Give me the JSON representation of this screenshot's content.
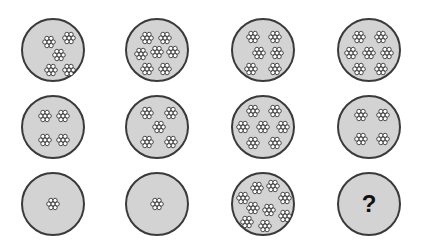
{
  "puzzle": {
    "rows": [
      [
        {
          "count": 5,
          "flowers": [
            [
              28,
              24
            ],
            [
              48,
              20
            ],
            [
              38,
              37
            ],
            [
              30,
              52
            ],
            [
              48,
              52
            ]
          ]
        },
        {
          "count": 7,
          "flowers": [
            [
              22,
              20
            ],
            [
              40,
              20
            ],
            [
              16,
              36
            ],
            [
              32,
              34
            ],
            [
              48,
              34
            ],
            [
              22,
              51
            ],
            [
              40,
              51
            ]
          ]
        },
        {
          "count": 6,
          "flowers": [
            [
              22,
              19
            ],
            [
              44,
              19
            ],
            [
              28,
              35
            ],
            [
              46,
              35
            ],
            [
              20,
              51
            ],
            [
              44,
              51
            ]
          ]
        },
        {
          "count": 7,
          "flowers": [
            [
              22,
              19
            ],
            [
              44,
              19
            ],
            [
              14,
              35
            ],
            [
              32,
              35
            ],
            [
              50,
              35
            ],
            [
              22,
              51
            ],
            [
              44,
              51
            ]
          ]
        }
      ],
      [
        {
          "count": 4,
          "flowers": [
            [
              24,
              21
            ],
            [
              42,
              21
            ],
            [
              24,
              45
            ],
            [
              42,
              45
            ]
          ]
        },
        {
          "count": 5,
          "flowers": [
            [
              22,
              18
            ],
            [
              46,
              18
            ],
            [
              34,
              32
            ],
            [
              22,
              47
            ],
            [
              46,
              47
            ]
          ]
        },
        {
          "count": 7,
          "flowers": [
            [
              22,
              16
            ],
            [
              44,
              16
            ],
            [
              12,
              32
            ],
            [
              32,
              32
            ],
            [
              52,
              32
            ],
            [
              22,
              48
            ],
            [
              44,
              48
            ]
          ]
        },
        {
          "count": 4,
          "flowers": [
            [
              24,
              20
            ],
            [
              46,
              20
            ],
            [
              24,
              44
            ],
            [
              46,
              44
            ]
          ]
        }
      ],
      [
        {
          "count": 1,
          "flowers": [
            [
              32,
              32
            ]
          ]
        },
        {
          "count": 1,
          "flowers": [
            [
              32,
              32
            ]
          ]
        },
        {
          "count": 9,
          "flowers": [
            [
              26,
              16
            ],
            [
              42,
              14
            ],
            [
              12,
              26
            ],
            [
              54,
              26
            ],
            [
              22,
              36
            ],
            [
              38,
              38
            ],
            [
              54,
              44
            ],
            [
              16,
              50
            ],
            [
              34,
              54
            ]
          ]
        },
        {
          "count": null,
          "label": "?"
        }
      ]
    ],
    "question_mark": "?"
  },
  "layout": {
    "col_centers": [
      53,
      157,
      263,
      369
    ],
    "row_centers": [
      50,
      127,
      204
    ],
    "diameter": 64
  },
  "colors": {
    "circle_fill": "#d3d3d3",
    "circle_stroke": "#3a3a3a",
    "flower_petal": "#ffffff",
    "flower_stroke": "#222222"
  }
}
